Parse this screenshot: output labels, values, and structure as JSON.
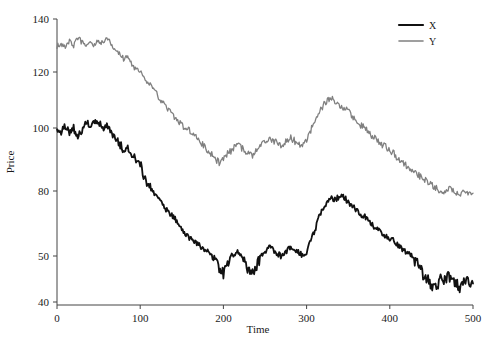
{
  "chart_data": {
    "type": "line",
    "title": "",
    "xlabel": "Time",
    "ylabel": "Price",
    "xlim": [
      0,
      500
    ],
    "ylim": [
      40,
      140
    ],
    "grid": false,
    "legend_position": "top-right",
    "xticks": [
      "0",
      "100",
      "200",
      "300",
      "400",
      "500"
    ],
    "xtick_values": [
      0,
      100,
      200,
      300,
      400,
      500
    ],
    "yticks": [
      "40",
      "50",
      "80",
      "100",
      "120",
      "140"
    ],
    "ytick_values": [
      40,
      50,
      80,
      100,
      120,
      140
    ],
    "colors": {
      "X": "#111111",
      "Y": "#808080"
    },
    "series": [
      {
        "name": "X",
        "color": "#111111",
        "width": 1.8,
        "x": [
          0,
          5,
          10,
          15,
          20,
          25,
          30,
          35,
          40,
          45,
          50,
          55,
          60,
          65,
          70,
          75,
          80,
          85,
          90,
          95,
          100,
          105,
          110,
          115,
          120,
          125,
          130,
          135,
          140,
          145,
          150,
          155,
          160,
          165,
          170,
          175,
          180,
          185,
          190,
          195,
          200,
          205,
          210,
          215,
          220,
          225,
          230,
          235,
          240,
          245,
          250,
          255,
          260,
          265,
          270,
          275,
          280,
          285,
          290,
          295,
          300,
          305,
          310,
          315,
          320,
          325,
          330,
          335,
          340,
          345,
          350,
          355,
          360,
          365,
          370,
          375,
          380,
          385,
          390,
          395,
          400,
          405,
          410,
          415,
          420,
          425,
          430,
          435,
          440,
          445,
          450,
          455,
          460,
          465,
          470,
          475,
          480,
          485,
          490,
          495,
          500
        ],
        "values": [
          100,
          99,
          101,
          98,
          100,
          97,
          99,
          102,
          101,
          103,
          102,
          100,
          101,
          99,
          97,
          95,
          93,
          94,
          92,
          90,
          89,
          84,
          82,
          80,
          77,
          75,
          72,
          70,
          68,
          66,
          63,
          60,
          58,
          57,
          55,
          54,
          52,
          51,
          49,
          47,
          46,
          48,
          50,
          52,
          51,
          49,
          47,
          46,
          48,
          50,
          52,
          54,
          53,
          51,
          50,
          52,
          54,
          53,
          52,
          50,
          52,
          57,
          62,
          68,
          72,
          75,
          77,
          76,
          78,
          77,
          75,
          73,
          71,
          69,
          68,
          66,
          64,
          62,
          61,
          59,
          58,
          57,
          55,
          53,
          52,
          50,
          49,
          48,
          46,
          45,
          44,
          43,
          45,
          44,
          46,
          45,
          44,
          43,
          45,
          44,
          44
        ]
      },
      {
        "name": "Y",
        "color": "#808080",
        "width": 1.3,
        "x": [
          0,
          5,
          10,
          15,
          20,
          25,
          30,
          35,
          40,
          45,
          50,
          55,
          60,
          65,
          70,
          75,
          80,
          85,
          90,
          95,
          100,
          105,
          110,
          115,
          120,
          125,
          130,
          135,
          140,
          145,
          150,
          155,
          160,
          165,
          170,
          175,
          180,
          185,
          190,
          195,
          200,
          205,
          210,
          215,
          220,
          225,
          230,
          235,
          240,
          245,
          250,
          255,
          260,
          265,
          270,
          275,
          280,
          285,
          290,
          295,
          300,
          305,
          310,
          315,
          320,
          325,
          330,
          335,
          340,
          345,
          350,
          355,
          360,
          365,
          370,
          375,
          380,
          385,
          390,
          395,
          400,
          405,
          410,
          415,
          420,
          425,
          430,
          435,
          440,
          445,
          450,
          455,
          460,
          465,
          470,
          475,
          480,
          485,
          490,
          495,
          500
        ],
        "values": [
          130,
          131,
          129,
          132,
          130,
          133,
          131,
          129,
          132,
          130,
          132,
          131,
          133,
          130,
          128,
          127,
          125,
          126,
          123,
          121,
          120,
          118,
          116,
          114,
          112,
          110,
          108,
          106,
          104,
          103,
          101,
          100,
          99,
          98,
          96,
          95,
          93,
          92,
          90,
          89,
          90,
          92,
          93,
          95,
          94,
          93,
          92,
          91,
          93,
          94,
          96,
          97,
          96,
          95,
          94,
          96,
          97,
          96,
          95,
          94,
          96,
          99,
          103,
          106,
          108,
          110,
          111,
          109,
          108,
          107,
          106,
          104,
          103,
          101,
          100,
          99,
          97,
          96,
          95,
          94,
          93,
          92,
          90,
          89,
          88,
          87,
          86,
          85,
          84,
          83,
          82,
          81,
          80,
          79,
          81,
          80,
          79,
          78,
          80,
          79,
          79
        ]
      }
    ]
  },
  "legend": {
    "entries": [
      {
        "label": "X"
      },
      {
        "label": "Y"
      }
    ]
  }
}
